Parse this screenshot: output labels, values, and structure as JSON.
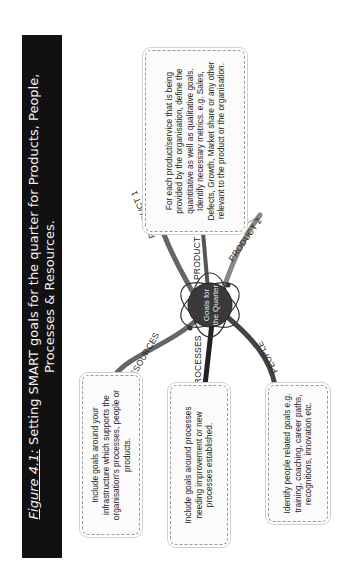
{
  "title": {
    "figure_label": "Figure 4.1:",
    "line1": "Setting SMART goals for the quarter for Products, People,",
    "line2": "Processes & Resources."
  },
  "center_node": {
    "label": "Goals for the Quarter"
  },
  "branches": {
    "product1": "PRODUCT 1",
    "product2": "PRODUCT 2",
    "product3": "PRODUCT 3",
    "resources": "RESOURCES",
    "processes": "PROCESSES",
    "people": "PEOPLE"
  },
  "notes": {
    "products": "For each product/service that is being provided by the organisation, define the quantitative as well as qualitative goals. Identify necessary metrics. e.g. Sales, Defects, Growth, Market share or any other relevant to the product or the organisation.",
    "resources": "Include goals around your infrastructure which supports the organisation's processes, people or products.",
    "processes": "Include goals around processes needing improvement or new processes established.",
    "people": "Identify people related goals e.g. training, coaching, career paths, recognitions, innovation etc."
  },
  "colors": {
    "title_bg": "#111111",
    "title_text": "#f2f2f2",
    "branch": "#555555",
    "center": "#3a3a3a"
  }
}
